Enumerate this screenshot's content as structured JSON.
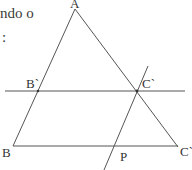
{
  "text_fragments": {
    "line1": "ndo o",
    "line2": ":"
  },
  "points": {
    "A": "A",
    "B": "B",
    "C": "C`",
    "B_prime": "B`",
    "C_prime": "C`",
    "P": "P"
  },
  "geometry": {
    "A": [
      75,
      9
    ],
    "B": [
      13,
      146
    ],
    "C": [
      178,
      147
    ],
    "B_prime": [
      38,
      91
    ],
    "C_prime": [
      137,
      91
    ],
    "P": [
      113,
      146
    ],
    "parallel_line": {
      "y": 91,
      "x_start": 5,
      "x_end": 185
    },
    "base_line": {
      "y": 146,
      "x_start": 13,
      "x_end": 178
    },
    "transversal": {
      "from": [
        104,
        170
      ],
      "to": [
        148,
        66
      ]
    }
  },
  "colors": {
    "line": "#555555",
    "text": "#333333"
  }
}
